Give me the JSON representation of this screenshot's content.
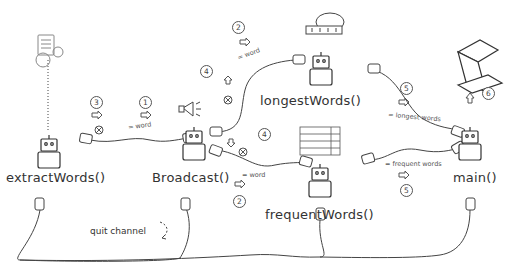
{
  "diagram": {
    "nodes": [
      {
        "id": "extractWords",
        "label": "extractWords()"
      },
      {
        "id": "broadcast",
        "label": "Broadcast()"
      },
      {
        "id": "longestWords",
        "label": "longestWords()"
      },
      {
        "id": "frequentWords",
        "label": "frequentWords()"
      },
      {
        "id": "main",
        "label": "main()"
      }
    ],
    "edges": [
      {
        "from": "extractWords",
        "to": "broadcast",
        "label": "= word",
        "steps": [
          "3",
          "1"
        ]
      },
      {
        "from": "broadcast",
        "to": "longestWords",
        "label": "= word",
        "steps": [
          "4",
          "2"
        ]
      },
      {
        "from": "broadcast",
        "to": "frequentWords",
        "label": "= word",
        "steps": [
          "4",
          "2"
        ]
      },
      {
        "from": "longestWords",
        "to": "main",
        "label": "= longest words",
        "steps": [
          "5"
        ]
      },
      {
        "from": "frequentWords",
        "to": "main",
        "label": "= frequent words",
        "steps": [
          "5"
        ]
      },
      {
        "from": "main",
        "to": "laptop",
        "label": "",
        "steps": [
          "6"
        ]
      }
    ],
    "quit_channel": {
      "label": "quit channel"
    },
    "step_numbers": {
      "s1": "1",
      "s2a": "2",
      "s2b": "2",
      "s3": "3",
      "s4a": "4",
      "s4b": "4",
      "s5a": "5",
      "s5b": "5",
      "s6": "6"
    },
    "edge_labels": {
      "word1": "= word",
      "word2": "= word",
      "word3": "= word",
      "longest": "= longest words",
      "frequent": "= frequent words"
    },
    "colors": {
      "ink": "#333333",
      "background": "#ffffff"
    }
  }
}
